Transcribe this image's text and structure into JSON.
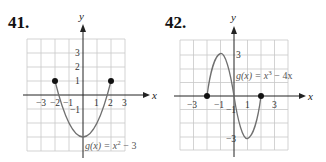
{
  "problems": [
    {
      "number": "41.",
      "function_label": "g(x) = x² − 3",
      "function_parts": {
        "pre": "g(x) = x",
        "sup": "2",
        "post": " − 3"
      },
      "axis_x": "x",
      "axis_y": "y",
      "x_ticks": [
        "−3",
        "−2",
        "−1",
        "1",
        "2",
        "3"
      ],
      "y_ticks": [
        "3",
        "2",
        "1",
        "−1"
      ],
      "endpoints": [
        [
          -2,
          1
        ],
        [
          2,
          1
        ]
      ]
    },
    {
      "number": "42.",
      "function_label": "g(x) = x³ − 4x",
      "function_parts": {
        "pre": "g(x) = x",
        "sup": "3",
        "post": " − 4x"
      },
      "axis_x": "x",
      "axis_y": "y",
      "x_ticks": [
        "−3",
        "−1",
        "1",
        "3"
      ],
      "y_ticks": [
        "3",
        "−1",
        "−3"
      ],
      "endpoints": [
        [
          -2,
          0
        ],
        [
          2,
          0
        ]
      ]
    }
  ],
  "colors": {
    "grid": "#c8c8c8",
    "axis": "#222222",
    "curve": "#707070",
    "point": "#111111"
  }
}
